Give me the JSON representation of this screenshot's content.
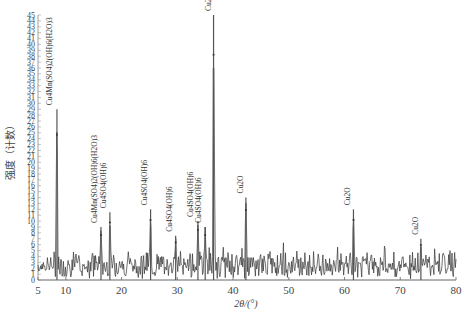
{
  "chart_data": {
    "type": "line",
    "title": "",
    "xlabel": "2θ/(°)",
    "ylabel": "强度（计数）",
    "xlim": [
      5,
      80
    ],
    "ylim": [
      0,
      45
    ],
    "xticks": [
      5,
      10,
      20,
      30,
      40,
      50,
      60,
      70,
      80
    ],
    "yticks": [
      0,
      1,
      2,
      3,
      4,
      5,
      6,
      7,
      8,
      9,
      10,
      11,
      12,
      13,
      14,
      15,
      16,
      17,
      18,
      19,
      20,
      21,
      22,
      23,
      24,
      25,
      26,
      27,
      28,
      29,
      30,
      31,
      32,
      33,
      34,
      35,
      36,
      37,
      38,
      39,
      40,
      41,
      42,
      43,
      44,
      45
    ],
    "grid": false,
    "legend": null,
    "series": [
      {
        "name": "XRD pattern",
        "color": "#333333",
        "peaks": [
          {
            "x": 8.4,
            "y": 29,
            "label": "Cu4Mn(SO4)2(OH)6(H2O)3"
          },
          {
            "x": 16.3,
            "y": 9,
            "label": "Cu4Mn(SO4)2(OH)6(H2O)3"
          },
          {
            "x": 17.9,
            "y": 11.5,
            "label": "Cu4SO4(OH)6"
          },
          {
            "x": 25.2,
            "y": 12,
            "label": "Cu4SO4(OH)6"
          },
          {
            "x": 29.7,
            "y": 7.5,
            "label": "Cu4SO4(OH)6"
          },
          {
            "x": 33.7,
            "y": 10,
            "label": "Cu4SO4(OH)6"
          },
          {
            "x": 35.0,
            "y": 9,
            "label": "Cu4SO4(OH)6"
          },
          {
            "x": 36.5,
            "y": 45,
            "label": "Cu2O"
          },
          {
            "x": 42.3,
            "y": 14,
            "label": "Cu2O"
          },
          {
            "x": 61.6,
            "y": 12,
            "label": "Cu2O"
          },
          {
            "x": 73.7,
            "y": 7,
            "label": "Cu2O"
          }
        ],
        "noise_level": 3.5
      }
    ],
    "annotations": [
      {
        "text": "Cu4Mn(SO4)2(OH)6(H2O)3",
        "x": 7.6
      },
      {
        "text": "Cu4Mn(SO4)2(OH)6(H2O)3",
        "x": 15.6
      },
      {
        "text": "Cu4SO4(OH)6",
        "x": 17.2
      },
      {
        "text": "Cu4SO4(OH)6",
        "x": 24.5
      },
      {
        "text": "Cu4SO4(OH)6",
        "x": 29.0
      },
      {
        "text": "Cu4SO4(OH)6",
        "x": 32.9
      },
      {
        "text": "Cu4SO4(OH)6",
        "x": 34.3
      },
      {
        "text": "Cu2O",
        "x": 36.0
      },
      {
        "text": "Cu2O",
        "x": 41.8
      },
      {
        "text": "Cu2O",
        "x": 61.0
      },
      {
        "text": "Cu2O",
        "x": 73.1
      }
    ]
  }
}
